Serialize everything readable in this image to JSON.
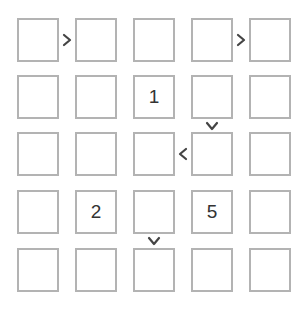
{
  "puzzle": {
    "type": "futoshiki",
    "size": 5,
    "grid": [
      [
        "",
        "",
        "",
        "",
        ""
      ],
      [
        "",
        "",
        "1",
        "",
        ""
      ],
      [
        "",
        "",
        "",
        "",
        ""
      ],
      [
        "",
        "2",
        "",
        "5",
        ""
      ],
      [
        "",
        "",
        "",
        "",
        ""
      ]
    ],
    "constraints": [
      {
        "between": [
          [
            0,
            0
          ],
          [
            0,
            1
          ]
        ],
        "symbol": ">",
        "orientation": "horizontal"
      },
      {
        "between": [
          [
            0,
            3
          ],
          [
            0,
            4
          ]
        ],
        "symbol": ">",
        "orientation": "horizontal"
      },
      {
        "between": [
          [
            1,
            3
          ],
          [
            2,
            3
          ]
        ],
        "symbol": "v",
        "orientation": "vertical"
      },
      {
        "between": [
          [
            2,
            2
          ],
          [
            2,
            3
          ]
        ],
        "symbol": "<",
        "orientation": "horizontal"
      },
      {
        "between": [
          [
            3,
            2
          ],
          [
            4,
            2
          ]
        ],
        "symbol": "v",
        "orientation": "vertical"
      }
    ],
    "colors": {
      "cell_border": "#b3b3b3",
      "operator": "#444444",
      "digit": "#333333"
    }
  }
}
